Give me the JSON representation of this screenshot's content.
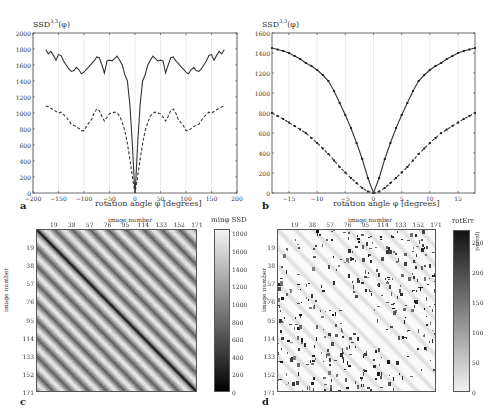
{
  "panels": {
    "a": {
      "letter": "a",
      "ylabel": "SSD",
      "ylabel_sup": "3,3",
      "ylabel_arg": "(φ)",
      "xlabel": "rotation angle φ  [degrees]",
      "xticks": [
        "-200",
        "-150",
        "-100",
        "-50",
        "0",
        "50",
        "100",
        "150",
        "200"
      ],
      "yticks": [
        "0",
        "200",
        "400",
        "600",
        "800",
        "1000",
        "1200",
        "1400",
        "1600",
        "1800",
        "2000"
      ]
    },
    "b": {
      "letter": "b",
      "ylabel": "SSD",
      "ylabel_sup": "3,3",
      "ylabel_arg": "(φ)",
      "xlabel": "rotation angle φ  [degrees]",
      "xticks": [
        "-15",
        "-10",
        "-5",
        "0",
        "5",
        "10",
        "15"
      ],
      "yticks": [
        "0",
        "200",
        "400",
        "600",
        "800",
        "1000",
        "1200",
        "1400",
        "1600"
      ]
    },
    "c": {
      "letter": "c",
      "top_axis_title": "image number",
      "left_axis_title": "image number",
      "ticks": [
        "19",
        "38",
        "57",
        "76",
        "95",
        "114",
        "133",
        "152",
        "171"
      ],
      "colorbar_title": "minφ SSD",
      "colorbar_ticks": [
        "0",
        "200",
        "400",
        "600",
        "800",
        "1000",
        "1200",
        "1400",
        "1600",
        "1800"
      ]
    },
    "d": {
      "letter": "d",
      "top_axis_title": "image number",
      "left_axis_title": "image number",
      "ticks": [
        "19",
        "38",
        "57",
        "76",
        "95",
        "114",
        "133",
        "152",
        "171"
      ],
      "colorbar_title": "rotErr",
      "colorbar_unit": "[pixels]",
      "colorbar_ticks": [
        "0",
        "50",
        "100",
        "150",
        "200",
        "250"
      ]
    }
  },
  "chart_data": [
    {
      "type": "line",
      "panel": "a",
      "title": "",
      "xlabel": "rotation angle φ [degrees]",
      "ylabel": "SSD^{3,3}(φ)",
      "xlim": [
        -200,
        200
      ],
      "ylim": [
        0,
        2000
      ],
      "grid": "vertical",
      "series": [
        {
          "name": "solid",
          "style": "solid",
          "x": [
            -175,
            -170,
            -165,
            -160,
            -155,
            -150,
            -145,
            -140,
            -135,
            -130,
            -125,
            -120,
            -115,
            -110,
            -105,
            -100,
            -95,
            -90,
            -85,
            -80,
            -75,
            -70,
            -65,
            -60,
            -55,
            -50,
            -45,
            -40,
            -35,
            -30,
            -25,
            -20,
            -15,
            -10,
            -5,
            -2,
            0,
            2,
            5,
            10,
            15,
            20,
            25,
            30,
            35,
            40,
            45,
            50,
            55,
            60,
            65,
            70,
            75,
            80,
            85,
            90,
            95,
            100,
            105,
            110,
            115,
            120,
            125,
            130,
            135,
            140,
            145,
            150,
            155,
            160,
            165,
            170,
            175
          ],
          "y": [
            1790,
            1740,
            1770,
            1720,
            1660,
            1730,
            1720,
            1650,
            1600,
            1550,
            1520,
            1530,
            1570,
            1540,
            1490,
            1510,
            1550,
            1580,
            1620,
            1650,
            1700,
            1690,
            1600,
            1500,
            1650,
            1660,
            1650,
            1680,
            1710,
            1660,
            1600,
            1480,
            1400,
            1100,
            600,
            200,
            0,
            200,
            600,
            1100,
            1400,
            1480,
            1600,
            1660,
            1710,
            1680,
            1650,
            1660,
            1650,
            1500,
            1600,
            1690,
            1700,
            1650,
            1620,
            1580,
            1550,
            1510,
            1490,
            1540,
            1570,
            1530,
            1520,
            1550,
            1600,
            1650,
            1720,
            1730,
            1660,
            1720,
            1770,
            1740,
            1790
          ]
        },
        {
          "name": "dashed",
          "style": "dashed",
          "x": [
            -175,
            -165,
            -150,
            -145,
            -135,
            -125,
            -115,
            -105,
            -100,
            -95,
            -85,
            -80,
            -75,
            -70,
            -65,
            -60,
            -55,
            -50,
            -40,
            -35,
            -30,
            -25,
            -20,
            -15,
            -10,
            -5,
            -2,
            0,
            2,
            5,
            10,
            15,
            20,
            25,
            30,
            35,
            40,
            50,
            55,
            60,
            65,
            70,
            75,
            80,
            85,
            95,
            100,
            105,
            115,
            125,
            135,
            145,
            150,
            165,
            175
          ],
          "y": [
            1090,
            1060,
            1000,
            1010,
            950,
            860,
            830,
            780,
            780,
            840,
            920,
            1000,
            1050,
            1030,
            960,
            900,
            950,
            990,
            1010,
            1000,
            960,
            880,
            780,
            620,
            420,
            200,
            80,
            0,
            80,
            200,
            420,
            620,
            780,
            880,
            960,
            1000,
            1010,
            990,
            950,
            900,
            960,
            1030,
            1050,
            1000,
            920,
            840,
            780,
            780,
            830,
            860,
            950,
            1010,
            1000,
            1060,
            1090
          ]
        }
      ]
    },
    {
      "type": "line",
      "panel": "b",
      "title": "",
      "xlabel": "rotation angle φ [degrees]",
      "ylabel": "SSD^{3,3}(φ)",
      "xlim": [
        -18,
        18
      ],
      "ylim": [
        0,
        1600
      ],
      "grid": "vertical",
      "series": [
        {
          "name": "solid",
          "style": "solid-markers",
          "x": [
            -18,
            -17,
            -16,
            -15,
            -14,
            -13,
            -12,
            -11,
            -10,
            -9,
            -8,
            -7,
            -6,
            -5,
            -4,
            -3,
            -2,
            -1,
            0,
            1,
            2,
            3,
            4,
            5,
            6,
            7,
            8,
            9,
            10,
            11,
            12,
            13,
            14,
            15,
            16,
            17,
            18
          ],
          "y": [
            1450,
            1435,
            1420,
            1400,
            1370,
            1340,
            1300,
            1270,
            1230,
            1180,
            1120,
            1020,
            900,
            780,
            650,
            500,
            340,
            150,
            0,
            150,
            340,
            500,
            650,
            780,
            900,
            1020,
            1120,
            1180,
            1230,
            1270,
            1300,
            1340,
            1370,
            1400,
            1420,
            1435,
            1450
          ]
        },
        {
          "name": "dashed",
          "style": "dashed-markers",
          "x": [
            -18,
            -17,
            -16,
            -15,
            -14,
            -13,
            -12,
            -11,
            -10,
            -9,
            -8,
            -7,
            -6,
            -5,
            -4,
            -3,
            -2,
            -1,
            0,
            1,
            2,
            3,
            4,
            5,
            6,
            7,
            8,
            9,
            10,
            11,
            12,
            13,
            14,
            15,
            16,
            17,
            18
          ],
          "y": [
            800,
            770,
            740,
            705,
            670,
            635,
            600,
            550,
            500,
            445,
            390,
            325,
            260,
            205,
            150,
            100,
            50,
            15,
            0,
            15,
            50,
            100,
            150,
            205,
            260,
            325,
            390,
            445,
            500,
            550,
            600,
            635,
            670,
            705,
            740,
            770,
            800
          ]
        }
      ]
    },
    {
      "type": "heatmap",
      "panel": "c",
      "xlabel": "image number",
      "ylabel": "image number",
      "x_ticks": [
        19,
        38,
        57,
        76,
        95,
        114,
        133,
        152,
        171
      ],
      "y_ticks": [
        19,
        38,
        57,
        76,
        95,
        114,
        133,
        152,
        171
      ],
      "colorbar_label": "minφ SSD",
      "colorbar_range": [
        0,
        1850
      ],
      "colormap": "gray",
      "description": "171x171 matrix, dark diagonal (low SSD), periodic block structure every 19 images with dark sub-diagonals"
    },
    {
      "type": "heatmap",
      "panel": "d",
      "xlabel": "image number",
      "ylabel": "image number",
      "x_ticks": [
        19,
        38,
        57,
        76,
        95,
        114,
        133,
        152,
        171
      ],
      "y_ticks": [
        19,
        38,
        57,
        76,
        95,
        114,
        133,
        152,
        171
      ],
      "colorbar_label": "rotErr [pixels]",
      "colorbar_range": [
        0,
        270
      ],
      "colormap": "gray_reversed",
      "description": "171x171 matrix, mostly light (low error) with dark outlier clusters in each 19x19 block"
    }
  ]
}
